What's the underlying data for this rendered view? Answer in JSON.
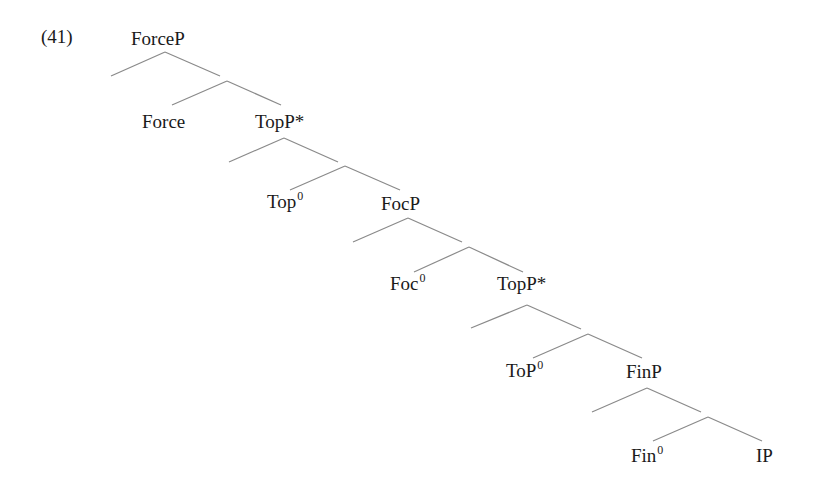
{
  "example_number": "(41)",
  "tree": {
    "nodes": [
      {
        "id": "forceP",
        "label": "ForceP",
        "sup": ""
      },
      {
        "id": "force",
        "label": "Force",
        "sup": ""
      },
      {
        "id": "topP1",
        "label": "TopP*",
        "sup": ""
      },
      {
        "id": "top0",
        "label": "Top",
        "sup": "0"
      },
      {
        "id": "focP",
        "label": "FocP",
        "sup": ""
      },
      {
        "id": "foc0",
        "label": "Foc",
        "sup": "0"
      },
      {
        "id": "topP2",
        "label": "TopP*",
        "sup": ""
      },
      {
        "id": "toP0",
        "label": "ToP",
        "sup": "0"
      },
      {
        "id": "finP",
        "label": "FinP",
        "sup": ""
      },
      {
        "id": "fin0",
        "label": "Fin",
        "sup": "0"
      },
      {
        "id": "ip",
        "label": "IP",
        "sup": ""
      }
    ],
    "structure": "[ForceP [ ] [ Force [TopP* [ ] [ Top0 [FocP [ ] [ Foc0 [TopP* [ ] [ ToP0 [FinP [ ] [ Fin0 IP ]]]]]]]]]]",
    "line_color": "#8a8a8a",
    "text_color": "#1a1a1a"
  }
}
